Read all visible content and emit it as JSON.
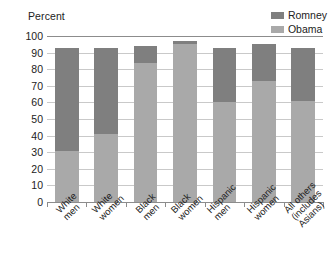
{
  "chart_data": {
    "type": "bar",
    "subtype": "stacked-bar",
    "title": "",
    "xlabel": "",
    "ylabel": "Percent",
    "ylim": [
      0,
      100
    ],
    "yticks": [
      100,
      90,
      80,
      70,
      60,
      50,
      40,
      30,
      20,
      10,
      0
    ],
    "grid": true,
    "legend_position": "top-right",
    "categories": [
      "White men",
      "White women",
      "Black men",
      "Black women",
      "Hispanic men",
      "Hispanic women",
      "All others (includes Asians)"
    ],
    "series": [
      {
        "name": "Obama",
        "color": "#a9a9a9",
        "values": [
          31,
          41,
          84,
          95,
          60,
          73,
          61
        ]
      },
      {
        "name": "Romney",
        "color": "#7f7f7f",
        "values": [
          62,
          52,
          10,
          2,
          33,
          22,
          32
        ]
      }
    ],
    "stack_tops": [
      93,
      93,
      94,
      97,
      93,
      95,
      93
    ]
  },
  "axis_title": "Percent",
  "legend": {
    "items": [
      {
        "label": "Romney",
        "color": "#7f7f7f"
      },
      {
        "label": "Obama",
        "color": "#a9a9a9"
      }
    ]
  },
  "y_axis": {
    "ticks": [
      "100",
      "90",
      "80",
      "70",
      "60",
      "50",
      "40",
      "30",
      "20",
      "10",
      "0"
    ]
  },
  "x_axis": {
    "labels": [
      [
        "White",
        "men"
      ],
      [
        "White",
        "women"
      ],
      [
        "Black",
        "men"
      ],
      [
        "Black",
        "women"
      ],
      [
        "Hispanic",
        "men"
      ],
      [
        "Hispanic",
        "women"
      ],
      [
        "All others",
        "(includes",
        "Asians)"
      ]
    ]
  }
}
